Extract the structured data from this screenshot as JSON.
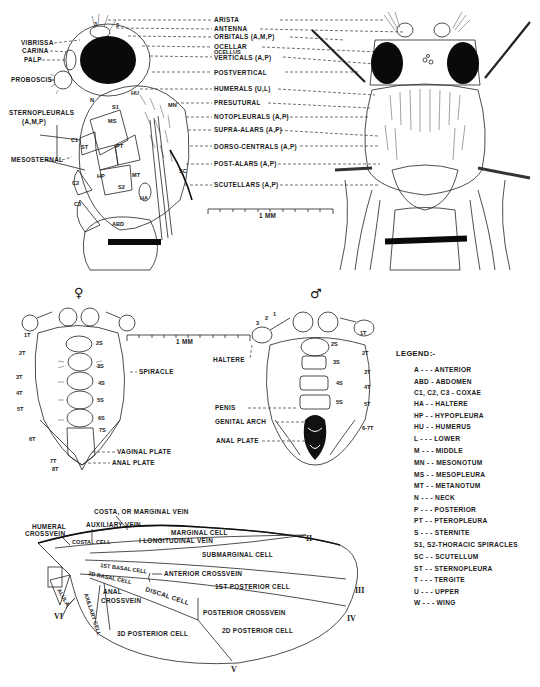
{
  "lateral_view": {
    "left_labels": [
      "VIBRISSA",
      "CARINA",
      "PALP",
      "PROBOSCIS",
      "STERNOPLEURALS",
      "(A,M,P)",
      "MESOSTERNAL"
    ],
    "right_labels": [
      "ARISTA",
      "ANTENNA",
      "ORBITALS (A,M,P)",
      "OCELLAR",
      "OCELLUS",
      "VERTICALS (A,P)",
      "POSTVERTICAL",
      "HUMERALS (U,L)",
      "PRESUTURAL",
      "NOTOPLEURALS (A,P)",
      "SUPRA-ALARS (A,P)",
      "DORSO-CENTRALS (A,P)",
      "POST-ALARS (A,P)",
      "SCUTELLARS (A,P)"
    ],
    "body_labels": [
      "N",
      "S1",
      "MS",
      "C1",
      "ST",
      "PT",
      "HP",
      "MT",
      "C2",
      "S2",
      "HA",
      "C3",
      "ABD",
      "HU",
      "MN",
      "SC",
      "3",
      "2"
    ],
    "scale_bar": "1 MM"
  },
  "female_abdomen": {
    "symbol": "♀",
    "tergites": [
      "1T",
      "2T",
      "3T",
      "4T",
      "5T",
      "6T",
      "7T",
      "8T"
    ],
    "sternites": [
      "2S",
      "3S",
      "4S",
      "5S",
      "6S",
      "7S"
    ],
    "callouts": [
      "SPIRACLE",
      "VAGINAL PLATE",
      "ANAL PLATE"
    ],
    "scale_bar": "1 MM"
  },
  "male_abdomen": {
    "symbol": "♂",
    "antenna_segments": [
      "3",
      "2",
      "1"
    ],
    "tergites": [
      "1T",
      "2T",
      "3T",
      "4T",
      "5T",
      "6-7T"
    ],
    "sternites": [
      "2S",
      "3S",
      "4S",
      "5S"
    ],
    "callouts": [
      "HALTERE",
      "PENIS",
      "GENITAL ARCH",
      "ANAL PLATE"
    ]
  },
  "legend": {
    "title": "LEGEND:-",
    "items": [
      "A - - - ANTERIOR",
      "ABD - ABDOMEN",
      "C1, C2, C3 - COXAE",
      "HA - - HALTERE",
      "HP - - HYPOPLEURA",
      "HU - - HUMERUS",
      "L - - - LOWER",
      "M - - - MIDDLE",
      "MN - - MESONOTUM",
      "MS - - MESOPLEURA",
      "MT - - METANOTUM",
      "N - - - NECK",
      "P - - - POSTERIOR",
      "PT - - PTEROPLEURA",
      "S - - - STERNITE",
      "S1, S2-THORACIC SPIRACLES",
      "SC - - SCUTELLUM",
      "ST - - STERNOPLEURA",
      "T - - - TERGITE",
      "U - - - UPPER",
      "W - - - WING"
    ]
  },
  "wing": {
    "labels": {
      "costa": "COSTA, OR MARGINAL VEIN",
      "humeral": "HUMERAL",
      "humeral2": "CROSSVEIN",
      "auxiliary": "AUXILIARY VEIN",
      "costal_cell": "COSTAL CELL",
      "marginal_cell": "MARGINAL CELL",
      "long_vein": "I LONGITUDINAL VEIN",
      "submarginal": "SUBMARGINAL CELL",
      "basal1": "1ST BASAL CELL",
      "basal2": "2D BASAL CELL",
      "ant_cross": "ANTERIOR CROSSVEIN",
      "post1": "1ST POSTERIOR CELL",
      "discal": "DISCAL CELL",
      "anal": "ANAL",
      "anal2": "CROSSVEIN",
      "alula": "ALULA",
      "axillary": "AXILLARY CELL",
      "post_cross": "POSTERIOR CROSSVEIN",
      "post3": "3D POSTERIOR CELL",
      "post2": "2D POSTERIOR CELL"
    },
    "vein_numerals": [
      "II",
      "III",
      "IV",
      "V",
      "VI"
    ]
  }
}
